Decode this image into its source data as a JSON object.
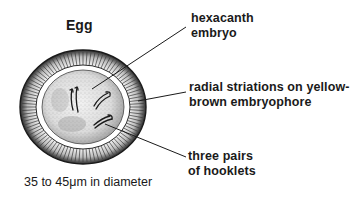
{
  "title": "Egg",
  "labels": {
    "hexacanth": {
      "line1": "hexacanth",
      "line2": "embryo"
    },
    "striations": {
      "line1": "radial striations on yellow-",
      "line2": "brown embryophore"
    },
    "hooklets": {
      "line1": "three pairs",
      "line2": "of hooklets"
    }
  },
  "caption": "35 to 45μm in diameter",
  "icons": [
    "egg-illustration-icon"
  ],
  "colors": {
    "ink": "#1a1a1a",
    "background": "#ffffff"
  }
}
